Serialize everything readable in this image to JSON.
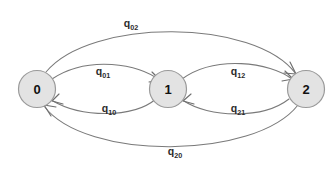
{
  "diagram": {
    "type": "state-transition-graph",
    "title": "",
    "background_color": "#ffffff",
    "node_fill_color": "#e3e3e3",
    "node_stroke_color": "#9a9a9a",
    "edge_color": "#7a7a7a",
    "label_color": "#2b2b2b",
    "nodes": [
      {
        "id": "0",
        "label": "0",
        "cx": 37,
        "cy": 89,
        "r": 18.5
      },
      {
        "id": "1",
        "label": "1",
        "cx": 168,
        "cy": 89,
        "r": 18.5
      },
      {
        "id": "2",
        "label": "2",
        "cx": 306,
        "cy": 89,
        "r": 18.5
      }
    ],
    "edges": [
      {
        "id": "e02",
        "from": "0",
        "to": "2",
        "label_base": "q",
        "label_sub": "02",
        "label_text": "q02",
        "label_x": 131,
        "label_y": 27,
        "path": "M 46,72 C 90,18 255,18 296,74",
        "arrow": "M 290,62 L 296,74 L 284,73"
      },
      {
        "id": "e01",
        "from": "0",
        "to": "1",
        "label_base": "q",
        "label_sub": "01",
        "label_text": "q01",
        "label_x": 103,
        "label_y": 75,
        "path": "M 52,79 C 88,55 140,64 159,80",
        "arrow": "M 152,72 L 160,80 L 149,82"
      },
      {
        "id": "e10",
        "from": "1",
        "to": "0",
        "label_base": "q",
        "label_sub": "10",
        "label_text": "q10",
        "label_x": 109,
        "label_y": 112,
        "path": "M 156,99 C 132,119 80,117 53,101",
        "arrow": "M 59,94 L 52,101 L 63,104"
      },
      {
        "id": "e12",
        "from": "1",
        "to": "2",
        "label_base": "q",
        "label_sub": "12",
        "label_text": "q12",
        "label_x": 238,
        "label_y": 75,
        "path": "M 182,79 C 215,55 270,62 292,79",
        "arrow": "M 285,71 L 293,79 L 282,81"
      },
      {
        "id": "e21",
        "from": "2",
        "to": "1",
        "label_base": "q",
        "label_sub": "21",
        "label_text": "q21",
        "label_x": 238,
        "label_y": 112,
        "path": "M 289,99 C 262,120 208,117 184,101",
        "arrow": "M 191,94 L 183,101 L 194,104"
      },
      {
        "id": "e20",
        "from": "2",
        "to": "0",
        "label_base": "q",
        "label_sub": "20",
        "label_text": "q20",
        "label_x": 175,
        "label_y": 155,
        "path": "M 298,105 C 255,160 85,161 44,106",
        "arrow": "M 51,116 L 44,105 L 56,107"
      }
    ]
  }
}
